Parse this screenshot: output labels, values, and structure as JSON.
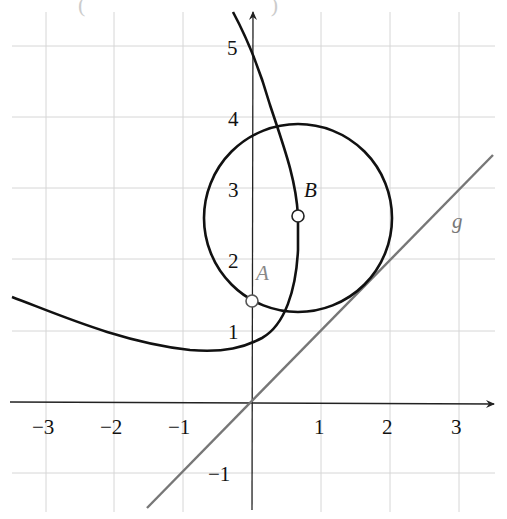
{
  "figure": {
    "top_fragment": "( )",
    "origin_px": [
      252,
      402
    ],
    "unit_px": [
      69,
      71
    ],
    "x_ticks": [
      "−3",
      "−2",
      "−1",
      "1",
      "2",
      "3"
    ],
    "x_tick_values": [
      -3,
      -2,
      -1,
      1,
      2,
      3
    ],
    "y_ticks": [
      "−1",
      "1",
      "2",
      "3",
      "4",
      "5"
    ],
    "y_tick_values": [
      -1,
      1,
      2,
      3,
      4,
      5
    ],
    "points": {
      "A": {
        "label": "A",
        "x": 0,
        "y": 1.41,
        "color": "#888888"
      },
      "B": {
        "label": "B",
        "x": 0.67,
        "y": 2.6,
        "color": "#111111"
      }
    },
    "line_g": {
      "label": "g",
      "equation": "y = x",
      "color": "#777777"
    },
    "circle": {
      "center": "B",
      "radius_units": 1.35,
      "color": "#111111"
    },
    "curve_color": "#111111",
    "grid_color": "#d6d6d6"
  }
}
